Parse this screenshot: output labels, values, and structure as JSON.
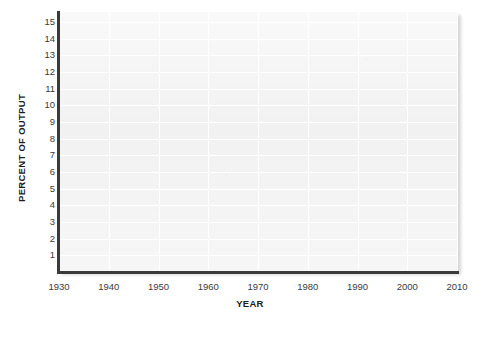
{
  "chart_data": {
    "type": "line",
    "title": "",
    "subtitle": "",
    "xlabel": "YEAR",
    "ylabel": "PERCENT OF OUTPUT",
    "x_ticks": [
      "1930",
      "1940",
      "1950",
      "1960",
      "1970",
      "1980",
      "1990",
      "2000",
      "2010"
    ],
    "y_ticks": [
      "15",
      "14",
      "13",
      "12",
      "11",
      "10",
      "9",
      "8",
      "7",
      "6",
      "5",
      "4",
      "3",
      "2",
      "1"
    ],
    "xlim": [
      1930,
      2010
    ],
    "ylim": [
      0,
      15.6
    ],
    "grid": true,
    "legend": null,
    "annotations": [],
    "series": [],
    "note": "Blank grid template — no data series are plotted in the figure."
  },
  "figure": {
    "plot_background_color": "#f2f2f2",
    "gridline_color": "#ffffff",
    "axis_line_color": "#3a3a3a",
    "page_background_color": "#ffffff",
    "tick_label_color": "#3b3b3b",
    "axis_title_color": "#1c1c1c"
  }
}
